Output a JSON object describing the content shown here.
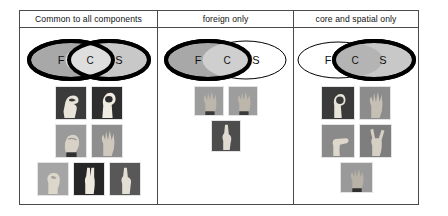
{
  "figure": {
    "panel_count": 3,
    "border_color": "#4a4a4a"
  },
  "panels": [
    {
      "id": "common-to-all",
      "header": "Common to all components",
      "venn": {
        "labels": {
          "left": "F",
          "center": "C",
          "right": "S"
        },
        "left_ellipse": {
          "highlighted": true,
          "fill": "#a8a8a8",
          "stroke_width": 4
        },
        "right_ellipse": {
          "highlighted": true,
          "fill": "#c8c8c8",
          "stroke_width": 4
        },
        "center_overlap": {
          "highlighted": true,
          "fill": "#dedede"
        }
      },
      "image_rows": [
        [
          {
            "name": "handshape-f1",
            "bg": "#3b3b3b",
            "hand": "#e8e4da",
            "pose": "claw"
          },
          {
            "name": "handshape-f2",
            "bg": "#2e2e2e",
            "hand": "#f0ece2",
            "pose": "o-shape"
          }
        ],
        [
          {
            "name": "handshape-f3",
            "bg": "#9a9a9a",
            "hand": "#d8d2c6",
            "pose": "fist"
          },
          {
            "name": "handshape-f4",
            "bg": "#8e8e8e",
            "hand": "#cfc9bd",
            "pose": "spread"
          }
        ],
        [
          {
            "name": "handshape-f5",
            "bg": "#a5a5a5",
            "hand": "#ddd7cb",
            "pose": "pinch"
          },
          {
            "name": "handshape-f6",
            "bg": "#262626",
            "hand": "#eee9df",
            "pose": "two-fingers"
          },
          {
            "name": "handshape-f7",
            "bg": "#585858",
            "hand": "#e4dfd4",
            "pose": "index-up"
          }
        ]
      ],
      "image_count": 7
    },
    {
      "id": "foreign-only",
      "header": "foreign only",
      "venn": {
        "labels": {
          "left": "F",
          "center": "C",
          "right": "S"
        },
        "left_ellipse": {
          "highlighted": true,
          "fill": "#a8a8a8",
          "stroke_width": 4
        },
        "right_ellipse": {
          "highlighted": false,
          "fill": "#ffffff",
          "stroke_width": 1
        },
        "center_overlap": {
          "highlighted": true,
          "fill": "#cfcfcf"
        }
      },
      "image_rows": [
        [
          {
            "name": "handshape-m1",
            "bg": "#9d9d9d",
            "hand": "#bdb7ab",
            "pose": "spread"
          },
          {
            "name": "handshape-m2",
            "bg": "#9d9d9d",
            "hand": "#bdb7ab",
            "pose": "spread"
          }
        ],
        [
          {
            "name": "handshape-m3",
            "bg": "#4d4d4d",
            "hand": "#e0dbd0",
            "pose": "index-up"
          }
        ]
      ],
      "image_count": 3
    },
    {
      "id": "core-and-spatial-only",
      "header": "core and spatial only",
      "venn": {
        "labels": {
          "left": "F",
          "center": "C",
          "right": "S"
        },
        "left_ellipse": {
          "highlighted": false,
          "fill": "#ffffff",
          "stroke_width": 1
        },
        "right_ellipse": {
          "highlighted": true,
          "fill": "#c8c8c8",
          "stroke_width": 4
        },
        "center_overlap": {
          "highlighted": true,
          "fill": "#b4b4b4"
        }
      },
      "image_rows": [
        [
          {
            "name": "handshape-r1",
            "bg": "#3a3a3a",
            "hand": "#e9e4da",
            "pose": "o-shape"
          },
          {
            "name": "handshape-r2",
            "bg": "#8c8c8c",
            "hand": "#c6c0b4",
            "pose": "spread"
          }
        ],
        [
          {
            "name": "handshape-r3",
            "bg": "#8a8a8a",
            "hand": "#ded8cc",
            "pose": "flat"
          },
          {
            "name": "handshape-r4",
            "bg": "#7e7e7e",
            "hand": "#d6d0c4",
            "pose": "horns"
          }
        ],
        [
          {
            "name": "handshape-r5",
            "bg": "#9a9a9a",
            "hand": "#b8b2a6",
            "pose": "claw"
          }
        ]
      ],
      "image_count": 5
    }
  ]
}
